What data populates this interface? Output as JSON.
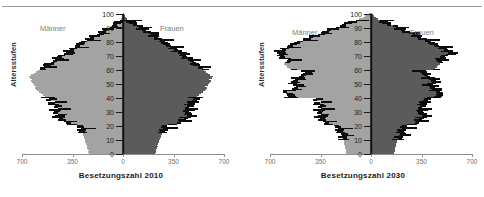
{
  "figure": {
    "divider_rule": "top-horizontal-rule",
    "colors": {
      "male_bar": "#a3a3a3",
      "female_bar": "#5b5b5b",
      "outline": "#0c0c0c",
      "axis": "#111111",
      "tick_label": "#6f6f6f",
      "group_label": "#7d7d7d"
    }
  },
  "panels": [
    {
      "id": "pyramid-2010",
      "title": "Besetzungszahl 2010",
      "ylabel": "Altersstufen",
      "male_label": "Männer",
      "female_label": "Frauen"
    },
    {
      "id": "pyramid-2030",
      "title": "Besetzungszahl 2030",
      "ylabel": "Altersstufen",
      "male_label": "Männer",
      "female_label": "Frauen"
    }
  ],
  "chart_data": [
    {
      "type": "bar",
      "title": "Besetzungszahl 2010",
      "subtitle": "",
      "orientation": "horizontal-population-pyramid",
      "xlabel": "Besetzungszahl 2010",
      "ylabel": "Altersstufen",
      "xlim": [
        -700,
        700
      ],
      "ylim": [
        0,
        100
      ],
      "xticks": [
        -700,
        -350,
        0,
        350,
        700
      ],
      "xticklabels": [
        "700",
        "350",
        "0",
        "350",
        "700"
      ],
      "yticks": [
        0,
        10,
        20,
        30,
        40,
        50,
        60,
        70,
        80,
        90,
        100
      ],
      "yticklabels": [
        "0",
        "10",
        "20",
        "30",
        "40",
        "50",
        "60",
        "70",
        "80",
        "90",
        "100"
      ],
      "grid": false,
      "legend": [
        "Männer",
        "Frauen"
      ],
      "legend_position": "inside-top-left-and-top-right",
      "annotations": [
        "Männer",
        "Frauen"
      ],
      "ages": [
        0,
        1,
        2,
        3,
        4,
        5,
        6,
        7,
        8,
        9,
        10,
        11,
        12,
        13,
        14,
        15,
        16,
        17,
        18,
        19,
        20,
        21,
        22,
        23,
        24,
        25,
        26,
        27,
        28,
        29,
        30,
        31,
        32,
        33,
        34,
        35,
        36,
        37,
        38,
        39,
        40,
        41,
        42,
        43,
        44,
        45,
        46,
        47,
        48,
        49,
        50,
        51,
        52,
        53,
        54,
        55,
        56,
        57,
        58,
        59,
        60,
        61,
        62,
        63,
        64,
        65,
        66,
        67,
        68,
        69,
        70,
        71,
        72,
        73,
        74,
        75,
        76,
        77,
        78,
        79,
        80,
        81,
        82,
        83,
        84,
        85,
        86,
        87,
        88,
        89,
        90,
        91,
        92,
        93,
        94,
        95,
        96,
        97,
        98,
        99,
        100
      ],
      "series": [
        {
          "name": "Männer",
          "side": "left",
          "values": [
            235,
            240,
            238,
            244,
            248,
            252,
            250,
            256,
            260,
            262,
            266,
            270,
            272,
            276,
            280,
            284,
            286,
            290,
            292,
            296,
            300,
            356,
            392,
            410,
            428,
            446,
            452,
            470,
            448,
            472,
            460,
            478,
            452,
            466,
            470,
            486,
            500,
            468,
            520,
            510,
            524,
            538,
            556,
            568,
            580,
            596,
            604,
            612,
            600,
            618,
            626,
            634,
            640,
            628,
            646,
            654,
            636,
            620,
            604,
            588,
            576,
            560,
            546,
            530,
            516,
            500,
            486,
            470,
            456,
            442,
            428,
            412,
            396,
            380,
            366,
            350,
            334,
            318,
            302,
            286,
            270,
            252,
            236,
            218,
            200,
            182,
            164,
            146,
            128,
            110,
            92,
            74,
            58,
            44,
            32,
            22,
            14,
            9,
            6,
            3,
            2
          ]
        },
        {
          "name": "Frauen",
          "side": "right",
          "values": [
            222,
            228,
            226,
            232,
            236,
            240,
            238,
            244,
            248,
            250,
            254,
            258,
            260,
            264,
            268,
            272,
            274,
            278,
            280,
            284,
            288,
            340,
            372,
            390,
            406,
            420,
            426,
            444,
            424,
            448,
            436,
            452,
            428,
            442,
            446,
            460,
            474,
            444,
            492,
            484,
            498,
            510,
            528,
            540,
            552,
            566,
            574,
            582,
            570,
            588,
            596,
            604,
            610,
            598,
            616,
            624,
            606,
            590,
            576,
            560,
            548,
            534,
            520,
            506,
            492,
            478,
            464,
            450,
            438,
            424,
            412,
            396,
            382,
            368,
            354,
            340,
            326,
            312,
            298,
            284,
            270,
            254,
            240,
            226,
            210,
            194,
            178,
            162,
            146,
            130,
            114,
            98,
            82,
            66,
            52,
            40,
            28,
            18,
            12,
            7,
            4
          ]
        }
      ],
      "outline_overlay": {
        "description": "black jagged outline traced over bar ends",
        "present": true,
        "emphasis_age_ranges": [
          [
            15,
            40
          ],
          [
            60,
            95
          ]
        ]
      }
    },
    {
      "type": "bar",
      "title": "Besetzungszahl 2030",
      "subtitle": "",
      "orientation": "horizontal-population-pyramid",
      "xlabel": "Besetzungszahl 2030",
      "ylabel": "Altersstufen",
      "xlim": [
        -700,
        700
      ],
      "ylim": [
        0,
        100
      ],
      "xticks": [
        -700,
        -350,
        0,
        350,
        700
      ],
      "xticklabels": [
        "700",
        "350",
        "0",
        "350",
        "700"
      ],
      "yticks": [
        0,
        10,
        20,
        30,
        40,
        50,
        60,
        70,
        80,
        90,
        100
      ],
      "yticklabels": [
        "0",
        "10",
        "20",
        "30",
        "40",
        "50",
        "60",
        "70",
        "80",
        "90",
        "100"
      ],
      "grid": false,
      "legend": [
        "Männer",
        "Frauen"
      ],
      "legend_position": "inside-top-left-and-top-right",
      "annotations": [
        "Männer",
        "Frauen"
      ],
      "ages": [
        0,
        1,
        2,
        3,
        4,
        5,
        6,
        7,
        8,
        9,
        10,
        11,
        12,
        13,
        14,
        15,
        16,
        17,
        18,
        19,
        20,
        21,
        22,
        23,
        24,
        25,
        26,
        27,
        28,
        29,
        30,
        31,
        32,
        33,
        34,
        35,
        36,
        37,
        38,
        39,
        40,
        41,
        42,
        43,
        44,
        45,
        46,
        47,
        48,
        49,
        50,
        51,
        52,
        53,
        54,
        55,
        56,
        57,
        58,
        59,
        60,
        61,
        62,
        63,
        64,
        65,
        66,
        67,
        68,
        69,
        70,
        71,
        72,
        73,
        74,
        75,
        76,
        77,
        78,
        79,
        80,
        81,
        82,
        83,
        84,
        85,
        86,
        87,
        88,
        89,
        90,
        91,
        92,
        93,
        94,
        95,
        96,
        97,
        98,
        99,
        100
      ],
      "series": [
        {
          "name": "Männer",
          "side": "left",
          "values": [
            170,
            172,
            174,
            176,
            178,
            180,
            182,
            186,
            188,
            190,
            194,
            196,
            200,
            204,
            208,
            212,
            216,
            220,
            226,
            232,
            238,
            296,
            318,
            330,
            342,
            352,
            358,
            366,
            346,
            360,
            352,
            364,
            344,
            352,
            356,
            366,
            376,
            350,
            390,
            384,
            560,
            572,
            580,
            588,
            596,
            570,
            548,
            534,
            520,
            506,
            544,
            552,
            538,
            524,
            510,
            496,
            482,
            468,
            454,
            440,
            556,
            568,
            580,
            592,
            604,
            596,
            584,
            572,
            600,
            614,
            628,
            640,
            652,
            636,
            618,
            600,
            580,
            560,
            540,
            516,
            494,
            470,
            446,
            420,
            396,
            370,
            344,
            318,
            292,
            266,
            240,
            214,
            186,
            160,
            132,
            104,
            80,
            58,
            40,
            24,
            14
          ]
        },
        {
          "name": "Frauen",
          "side": "right",
          "values": [
            160,
            162,
            164,
            166,
            168,
            170,
            172,
            176,
            178,
            180,
            184,
            186,
            190,
            194,
            198,
            202,
            206,
            210,
            216,
            222,
            228,
            282,
            302,
            314,
            326,
            336,
            342,
            350,
            330,
            344,
            336,
            348,
            328,
            336,
            340,
            350,
            360,
            334,
            374,
            368,
            430,
            440,
            448,
            456,
            464,
            442,
            424,
            412,
            400,
            388,
            418,
            426,
            414,
            402,
            390,
            378,
            366,
            354,
            342,
            330,
            430,
            442,
            454,
            466,
            478,
            470,
            460,
            450,
            478,
            492,
            508,
            522,
            536,
            522,
            506,
            490,
            472,
            454,
            436,
            416,
            396,
            376,
            354,
            332,
            310,
            288,
            264,
            242,
            218,
            196,
            172,
            150,
            126,
            104,
            84,
            64,
            46,
            32,
            20,
            12,
            7
          ]
        }
      ],
      "outline_overlay": {
        "description": "black jagged outline traced over bar ends",
        "present": true,
        "emphasis_age_ranges": [
          [
            10,
            40
          ],
          [
            40,
            60
          ],
          [
            65,
            95
          ]
        ]
      }
    }
  ]
}
